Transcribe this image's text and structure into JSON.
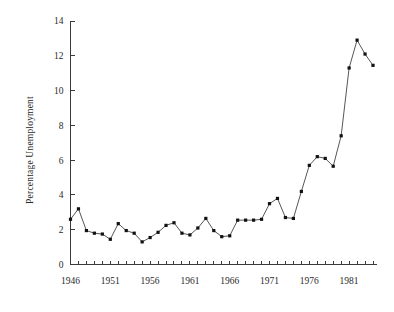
{
  "chart_data": {
    "type": "line",
    "title": "",
    "subtitle": "",
    "xlabel": "",
    "ylabel": "Percentage Unemployment",
    "xlim": [
      1946,
      1984
    ],
    "ylim": [
      0,
      14
    ],
    "grid": false,
    "legend": null,
    "y_ticks": [
      0,
      2,
      4,
      6,
      8,
      10,
      12,
      14
    ],
    "y_tick_labels": [
      "0",
      "2",
      "4",
      "6",
      "8",
      "10",
      "12",
      "14"
    ],
    "x_ticks": [
      1946,
      1951,
      1956,
      1961,
      1966,
      1971,
      1976,
      1981
    ],
    "x_tick_labels": [
      "1946",
      "1951",
      "1956",
      "1961",
      "1966",
      "1971",
      "1976",
      "1981"
    ],
    "x_minor_tick_interval": 1,
    "marker": "filled-square",
    "line_color": "#2b2b2b",
    "marker_color": "#111111",
    "background_color": "#ffffff",
    "x": [
      1946,
      1947,
      1948,
      1949,
      1950,
      1951,
      1952,
      1953,
      1954,
      1955,
      1956,
      1957,
      1958,
      1959,
      1960,
      1961,
      1962,
      1963,
      1964,
      1965,
      1966,
      1967,
      1968,
      1969,
      1970,
      1971,
      1972,
      1973,
      1974,
      1975,
      1976,
      1977,
      1978,
      1979,
      1980,
      1981,
      1982,
      1983,
      1984
    ],
    "categories": [
      "1946",
      "1947",
      "1948",
      "1949",
      "1950",
      "1951",
      "1952",
      "1953",
      "1954",
      "1955",
      "1956",
      "1957",
      "1958",
      "1959",
      "1960",
      "1961",
      "1962",
      "1963",
      "1964",
      "1965",
      "1966",
      "1967",
      "1968",
      "1969",
      "1970",
      "1971",
      "1972",
      "1973",
      "1974",
      "1975",
      "1976",
      "1977",
      "1978",
      "1979",
      "1980",
      "1981",
      "1982",
      "1983",
      "1984"
    ],
    "values": [
      2.6,
      3.2,
      1.95,
      1.8,
      1.75,
      1.45,
      2.35,
      1.95,
      1.8,
      1.3,
      1.55,
      1.85,
      2.25,
      2.4,
      1.8,
      1.7,
      2.1,
      2.65,
      1.95,
      1.6,
      1.65,
      2.55,
      2.55,
      2.55,
      2.6,
      3.5,
      3.8,
      2.7,
      2.65,
      4.2,
      5.7,
      6.2,
      6.1,
      5.65,
      7.4,
      11.3,
      12.9,
      12.1,
      11.45
    ],
    "series": [
      {
        "name": "Percentage Unemployment",
        "values": [
          2.6,
          3.2,
          1.95,
          1.8,
          1.75,
          1.45,
          2.35,
          1.95,
          1.8,
          1.3,
          1.55,
          1.85,
          2.25,
          2.4,
          1.8,
          1.7,
          2.1,
          2.65,
          1.95,
          1.6,
          1.65,
          2.55,
          2.55,
          2.55,
          2.6,
          3.5,
          3.8,
          2.7,
          2.65,
          4.2,
          5.7,
          6.2,
          6.1,
          5.65,
          7.4,
          11.3,
          12.9,
          12.1,
          11.45
        ]
      }
    ]
  },
  "axes": {
    "y_axis_label": "Percentage Unemployment"
  }
}
